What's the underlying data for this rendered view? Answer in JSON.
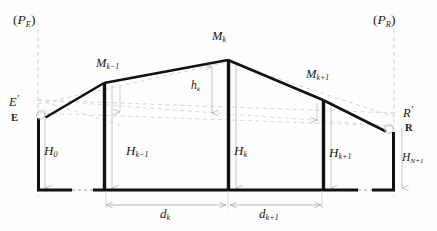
{
  "figure": {
    "labels": {
      "left_plane": "P",
      "left_plane_sub": "E",
      "right_plane": "P",
      "right_plane_sub": "R",
      "mast_prev": "M",
      "mast_prev_sub": "k−1",
      "mast_mid": "M",
      "mast_mid_sub": "k",
      "mast_next": "M",
      "mast_next_sub": "k+1",
      "sag_height": "h",
      "sag_height_sub": "k",
      "height_0": "H",
      "height_0_sub": "0",
      "height_prev": "H",
      "height_prev_sub": "k−1",
      "height_mid": "H",
      "height_mid_sub": "k",
      "height_next": "H",
      "height_next_sub": "k+1",
      "height_last": "H",
      "height_last_sub": "N+1",
      "span_k": "d",
      "span_k_sub": "k",
      "span_k1": "d",
      "span_k1_sub": "k+1",
      "point_e_prime": "E",
      "point_e": "E",
      "point_r_prime": "R",
      "point_r": "R",
      "prime_mark": "′"
    },
    "colors": {
      "profile_line": "#111111",
      "mast_line": "#111111",
      "ground_line": "#111111",
      "construction_line": "#c9c9c9",
      "dimension_line": "#b0b0b0",
      "text": "#1a1a1a",
      "background": "#fdfdfd"
    },
    "geometry": {
      "ground_y": 190,
      "mast_x": [
        38,
        104,
        228,
        323,
        394
      ],
      "mast_top_y": [
        118,
        83,
        60,
        100,
        132
      ],
      "plane_left_x": 38,
      "plane_right_x": 394,
      "sag_top_y": 60,
      "sag_bottom_y": 113,
      "dim_y": 205,
      "dim_x": [
        104,
        228,
        323
      ]
    }
  }
}
